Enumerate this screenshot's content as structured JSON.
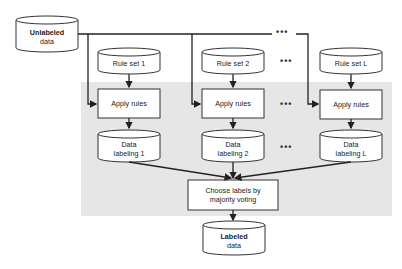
{
  "diagram": {
    "nodes": {
      "unlabeled": {
        "line1": "Unlabeled",
        "line2": "data"
      },
      "rule_sets": [
        {
          "label": "Rule set 1"
        },
        {
          "label": "Rule set 2"
        },
        {
          "label": "Rule set L"
        }
      ],
      "apply_rules": [
        {
          "label": "Apply rules"
        },
        {
          "label": "Apply rules"
        },
        {
          "label": "Apply rules"
        }
      ],
      "data_labeling": [
        {
          "line1": "Data",
          "line2": "labeling 1"
        },
        {
          "line1": "Data",
          "line2": "labeling 2"
        },
        {
          "line1": "Data",
          "line2": "labeling L"
        }
      ],
      "choose": {
        "line1": "Choose labels by",
        "line2": "majority voting"
      },
      "labeled": {
        "line1": "Labeled",
        "line2": "data"
      }
    },
    "ellipsis": "•••",
    "colors": {
      "stroke": "#333333",
      "shade": "#e6e6e6",
      "fill": "#ffffff"
    }
  }
}
